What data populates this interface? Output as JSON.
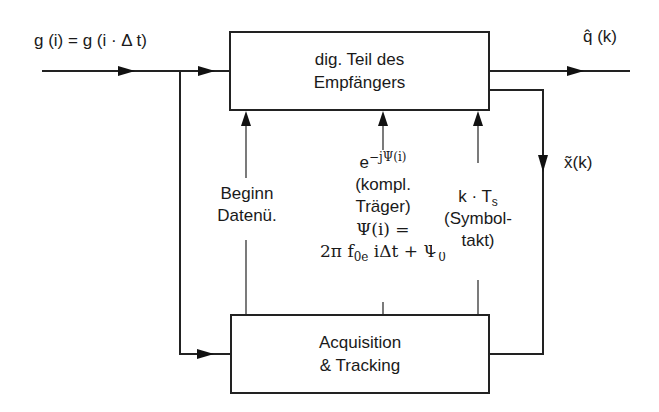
{
  "diagram": {
    "blocks": {
      "receiver": {
        "line1": "dig. Teil des",
        "line2": "Empfängers"
      },
      "acquisition": {
        "line1": "Acquisition",
        "line2": "& Tracking"
      }
    },
    "signals": {
      "input": {
        "text": "g (i) = g (i · Δ t)"
      },
      "output_q": {
        "base": "q̂",
        "arg": "(k)"
      },
      "output_x": {
        "base": "x̃",
        "arg": "(k)"
      }
    },
    "control_signals": {
      "data_start": {
        "line1": "Beginn",
        "line2": "Datenü."
      },
      "carrier": {
        "exp_base": "e",
        "exp_sup": "−jΨ(i)",
        "line2": "(kompl.",
        "line3": "Träger)",
        "line4": "Ψ(i) =",
        "line5_a": "2π f",
        "line5_sub": "0e",
        "line5_b": " iΔt + Ψ",
        "line5_sub2": "0"
      },
      "symbol_clock": {
        "line1_a": "k · T",
        "line1_sub": "s",
        "line2": "(Symbol-",
        "line3": "takt)"
      }
    }
  }
}
